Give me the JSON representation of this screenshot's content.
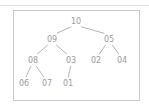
{
  "frame": {
    "border_color": "#c9c9c9",
    "background": "#ffffff",
    "rule_color": "#e2e2e2"
  },
  "diagram": {
    "kind": "binary-tree",
    "label_color": "#9a9a9a",
    "edge_color": "#b5b5b5",
    "nodes": [
      {
        "id": "n10",
        "label": "10",
        "x": 62,
        "y": 10,
        "level": 0
      },
      {
        "id": "n09",
        "label": "09",
        "x": 38,
        "y": 28,
        "level": 1
      },
      {
        "id": "n05",
        "label": "05",
        "x": 95,
        "y": 28,
        "level": 1
      },
      {
        "id": "n08",
        "label": "08",
        "x": 19,
        "y": 49,
        "level": 2
      },
      {
        "id": "n03",
        "label": "03",
        "x": 57,
        "y": 49,
        "level": 2
      },
      {
        "id": "n02",
        "label": "02",
        "x": 82,
        "y": 49,
        "level": 2
      },
      {
        "id": "n04",
        "label": "04",
        "x": 108,
        "y": 49,
        "level": 2
      },
      {
        "id": "n06",
        "label": "06",
        "x": 10,
        "y": 72,
        "level": 3
      },
      {
        "id": "n07",
        "label": "07",
        "x": 33,
        "y": 72,
        "level": 3
      },
      {
        "id": "n01",
        "label": "01",
        "x": 54,
        "y": 72,
        "level": 3
      }
    ],
    "edges": [
      {
        "from": "n10",
        "to": "n09"
      },
      {
        "from": "n10",
        "to": "n05"
      },
      {
        "from": "n09",
        "to": "n08"
      },
      {
        "from": "n09",
        "to": "n03"
      },
      {
        "from": "n05",
        "to": "n02"
      },
      {
        "from": "n05",
        "to": "n04"
      },
      {
        "from": "n08",
        "to": "n06"
      },
      {
        "from": "n08",
        "to": "n07"
      },
      {
        "from": "n03",
        "to": "n01"
      }
    ]
  }
}
